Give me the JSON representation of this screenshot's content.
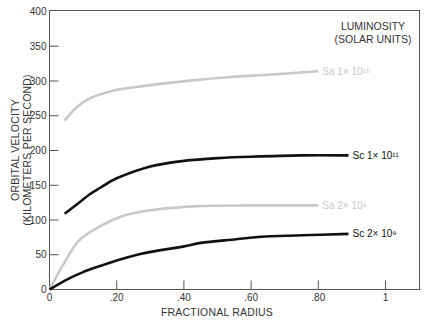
{
  "chart_data": {
    "type": "line",
    "title": "",
    "xlabel": "FRACTIONAL RADIUS",
    "ylabel_line1": "ORBITAL VELOCITY",
    "ylabel_line2": "(KILOMETERS PER SECOND)",
    "xlim": [
      0,
      1.1
    ],
    "ylim": [
      0,
      400
    ],
    "grid": false,
    "x_ticks": [
      {
        "value": 0,
        "label": "0"
      },
      {
        "value": 0.2,
        "label": ".20"
      },
      {
        "value": 0.4,
        "label": ".40"
      },
      {
        "value": 0.6,
        "label": ".60"
      },
      {
        "value": 0.8,
        "label": ".80"
      },
      {
        "value": 1.0,
        "label": "1"
      }
    ],
    "y_ticks": [
      {
        "value": 0,
        "label": "0"
      },
      {
        "value": 50,
        "label": "50"
      },
      {
        "value": 100,
        "label": "100"
      },
      {
        "value": 150,
        "label": "150"
      },
      {
        "value": 200,
        "label": "200"
      },
      {
        "value": 250,
        "label": "250"
      },
      {
        "value": 300,
        "label": "300"
      },
      {
        "value": 350,
        "label": "350"
      },
      {
        "value": 400,
        "label": "400"
      }
    ],
    "legend": {
      "title_line1": "LUMINOSITY",
      "title_line2": "(SOLAR UNITS)",
      "position": "top-right"
    },
    "series": [
      {
        "name": "Sa 1× 10¹¹",
        "color": "#c8c8c8",
        "x": [
          0.045,
          0.08,
          0.12,
          0.18,
          0.25,
          0.35,
          0.45,
          0.55,
          0.65,
          0.8
        ],
        "y": [
          243,
          262,
          275,
          285,
          291,
          297,
          302,
          306,
          309,
          314
        ]
      },
      {
        "name": "Sc 1× 10¹¹",
        "color": "#111111",
        "x": [
          0.045,
          0.08,
          0.12,
          0.15,
          0.2,
          0.3,
          0.4,
          0.5,
          0.6,
          0.75,
          0.89
        ],
        "y": [
          109,
          122,
          137,
          146,
          160,
          177,
          185,
          189,
          191,
          193,
          193
        ]
      },
      {
        "name": "Sa 2× 10⁹",
        "color": "#c8c8c8",
        "x": [
          0.0,
          0.04,
          0.087,
          0.15,
          0.22,
          0.3,
          0.44,
          0.6,
          0.8
        ],
        "y": [
          0,
          35,
          70,
          91,
          106,
          114,
          120,
          121,
          121
        ]
      },
      {
        "name": "Sc 2× 10⁹",
        "color": "#111111",
        "x": [
          0.0,
          0.05,
          0.1,
          0.15,
          0.27,
          0.4,
          0.45,
          0.55,
          0.63,
          0.75,
          0.89
        ],
        "y": [
          0,
          14,
          25,
          34,
          51,
          62,
          67,
          72,
          76,
          78,
          80
        ]
      }
    ]
  }
}
